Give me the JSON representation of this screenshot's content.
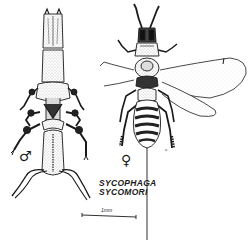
{
  "figure": {
    "species_name": {
      "genus": "SYCOPHAGA",
      "epithet": "SYCOMORI"
    },
    "specimens": [
      {
        "sex": "male",
        "symbol": "♂",
        "description": "wingless male fig wasp, dorsal view"
      },
      {
        "sex": "female",
        "symbol": "♀",
        "description": "winged female fig wasp with long ovipositor, dorsal view"
      }
    ],
    "scale_bar": {
      "label": "1mm"
    },
    "part_label": "a",
    "colors": {
      "ink": "#1a1a1a",
      "background": "#ffffff",
      "stipple": "#8a8a8a"
    }
  }
}
